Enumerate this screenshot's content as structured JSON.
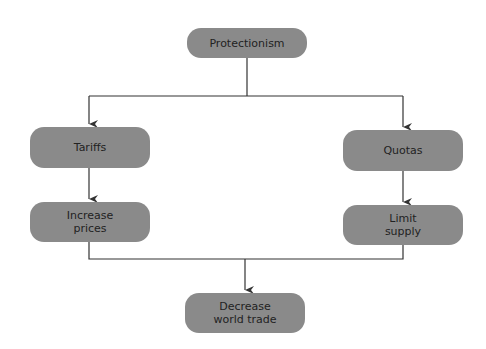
{
  "nodes": {
    "protectionism": "Protectionism",
    "tariffs": "Tariffs",
    "quotas": "Quotas",
    "increase_prices": "Increase\nprices",
    "limit_supply": "Limit\nsupply",
    "decrease_trade": "Decrease\nworld trade"
  },
  "colors": {
    "box": "#8a8a8a",
    "line": "#333333"
  },
  "edges": [
    [
      "Protectionism",
      "Tariffs"
    ],
    [
      "Protectionism",
      "Quotas"
    ],
    [
      "Tariffs",
      "Increase prices"
    ],
    [
      "Quotas",
      "Limit supply"
    ],
    [
      "Increase prices",
      "Decrease world trade"
    ],
    [
      "Limit supply",
      "Decrease world trade"
    ]
  ]
}
